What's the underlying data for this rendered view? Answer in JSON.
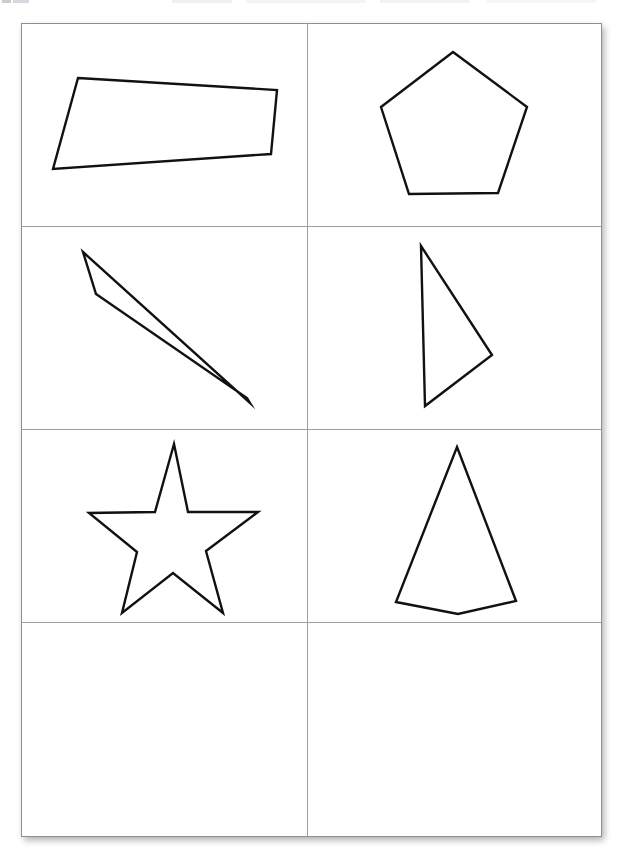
{
  "page": {
    "width": 618,
    "height": 859,
    "background_color": "#ffffff",
    "sheet": {
      "left": 21,
      "top": 23,
      "right": 601,
      "bottom": 836,
      "fill_color": "#ffffff",
      "border_color": "#8b8f95",
      "border_width": 1,
      "shadow": "3px 4px 7px rgba(0,0,0,0.33)"
    },
    "grid": {
      "columns": 2,
      "rows": 4,
      "divider_color": "#9a9ea4",
      "divider_width": 1,
      "vertical_dividers_x": [
        307
      ],
      "horizontal_dividers_y": [
        226,
        429,
        622
      ]
    },
    "shape_style": {
      "stroke_color": "#111111",
      "fill": "none",
      "stroke_width": 2.4,
      "stroke_linejoin": "miter"
    }
  },
  "cells": [
    {
      "id": "cell-r1c1",
      "row": 1,
      "column": 1,
      "shape_name": "bowtie-quadrilateral",
      "shape_label": "Self-intersecting bowtie quadrilateral",
      "vertex_count": 4,
      "closed": true,
      "points": [
        [
          78,
          78
        ],
        [
          277,
          90
        ],
        [
          271,
          154
        ],
        [
          53,
          169
        ]
      ],
      "empty": false
    },
    {
      "id": "cell-r1c2",
      "row": 1,
      "column": 2,
      "shape_name": "pentagon",
      "shape_label": "Regular pentagon",
      "vertex_count": 5,
      "closed": true,
      "points": [
        [
          453,
          52
        ],
        [
          527,
          107
        ],
        [
          498,
          193
        ],
        [
          409,
          194
        ],
        [
          381,
          107
        ]
      ],
      "empty": false
    },
    {
      "id": "cell-r2c1",
      "row": 2,
      "column": 1,
      "shape_name": "sliver-quadrilateral",
      "shape_label": "Thin sliver quadrilateral",
      "vertex_count": 4,
      "closed": true,
      "points": [
        [
          83,
          252
        ],
        [
          250,
          403
        ],
        [
          247,
          398
        ],
        [
          96,
          294
        ]
      ],
      "empty": false
    },
    {
      "id": "cell-r2c2",
      "row": 2,
      "column": 2,
      "shape_name": "right-pointing-triangle",
      "shape_label": "Right-pointing scalene triangle",
      "vertex_count": 3,
      "closed": true,
      "points": [
        [
          421,
          246
        ],
        [
          492,
          355
        ],
        [
          425,
          406
        ]
      ],
      "empty": false
    },
    {
      "id": "cell-r3c1",
      "row": 3,
      "column": 1,
      "shape_name": "five-pointed-star",
      "shape_label": "Five-pointed star polygon",
      "vertex_count": 10,
      "closed": true,
      "points": [
        [
          174,
          444
        ],
        [
          188,
          512
        ],
        [
          258,
          512
        ],
        [
          206,
          551
        ],
        [
          223,
          613
        ],
        [
          173,
          573
        ],
        [
          122,
          613
        ],
        [
          137,
          552
        ],
        [
          89,
          513
        ],
        [
          155,
          512
        ]
      ],
      "empty": false
    },
    {
      "id": "cell-r3c2",
      "row": 3,
      "column": 2,
      "shape_name": "kite-arrowhead-quadrilateral",
      "shape_label": "Tall kite / arrowhead quadrilateral",
      "vertex_count": 4,
      "closed": true,
      "points": [
        [
          457,
          447
        ],
        [
          516,
          601
        ],
        [
          458,
          614
        ],
        [
          396,
          602
        ]
      ],
      "empty": false
    },
    {
      "id": "cell-r4c1",
      "row": 4,
      "column": 1,
      "shape_name": "empty-cell",
      "shape_label": "Empty cell",
      "vertex_count": 0,
      "closed": false,
      "points": [],
      "empty": true
    },
    {
      "id": "cell-r4c2",
      "row": 4,
      "column": 2,
      "shape_name": "empty-cell",
      "shape_label": "Empty cell",
      "vertex_count": 0,
      "closed": false,
      "points": [],
      "empty": true
    }
  ],
  "cell_bounds": [
    {
      "id": "cell-r1c1",
      "left": 21,
      "top": 23,
      "width": 286,
      "height": 203
    },
    {
      "id": "cell-r1c2",
      "left": 307,
      "top": 23,
      "width": 294,
      "height": 203
    },
    {
      "id": "cell-r2c1",
      "left": 21,
      "top": 226,
      "width": 286,
      "height": 203
    },
    {
      "id": "cell-r2c2",
      "left": 307,
      "top": 226,
      "width": 294,
      "height": 203
    },
    {
      "id": "cell-r3c1",
      "left": 21,
      "top": 429,
      "width": 286,
      "height": 193
    },
    {
      "id": "cell-r3c2",
      "left": 307,
      "top": 429,
      "width": 294,
      "height": 193
    },
    {
      "id": "cell-r4c1",
      "left": 21,
      "top": 622,
      "width": 286,
      "height": 214
    },
    {
      "id": "cell-r4c2",
      "left": 307,
      "top": 622,
      "width": 294,
      "height": 214
    }
  ]
}
